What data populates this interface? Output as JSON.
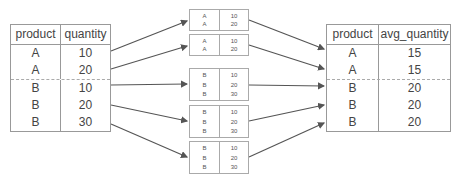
{
  "left_table": {
    "headers": [
      "product",
      "quantity"
    ],
    "rows": [
      [
        "A",
        "10"
      ],
      [
        "A",
        "20"
      ],
      [
        "B",
        "10"
      ],
      [
        "B",
        "20"
      ],
      [
        "B",
        "30"
      ]
    ]
  },
  "windows": [
    {
      "rows": [
        [
          "A",
          "10"
        ],
        [
          "A",
          "20"
        ]
      ]
    },
    {
      "rows": [
        [
          "A",
          "10"
        ],
        [
          "A",
          "20"
        ]
      ]
    },
    {
      "rows": [
        [
          "B",
          "10"
        ],
        [
          "B",
          "20"
        ],
        [
          "B",
          "30"
        ]
      ]
    },
    {
      "rows": [
        [
          "B",
          "10"
        ],
        [
          "B",
          "20"
        ],
        [
          "B",
          "30"
        ]
      ]
    },
    {
      "rows": [
        [
          "B",
          "10"
        ],
        [
          "B",
          "20"
        ],
        [
          "B",
          "30"
        ]
      ]
    }
  ],
  "right_table": {
    "headers": [
      "product",
      "avg_quantity"
    ],
    "rows": [
      [
        "A",
        "15"
      ],
      [
        "A",
        "15"
      ],
      [
        "B",
        "20"
      ],
      [
        "B",
        "20"
      ],
      [
        "B",
        "20"
      ]
    ]
  },
  "colors": {
    "line": "#555555",
    "border": "#999999",
    "text": "#444444"
  }
}
